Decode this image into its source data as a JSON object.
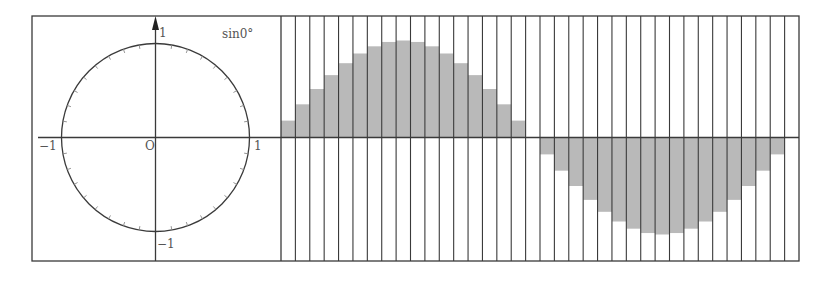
{
  "figure": {
    "title_label": "sin0°",
    "unit_circle": {
      "center": [
        155.5,
        137.5
      ],
      "radius": 94,
      "tick_step_deg": 10,
      "labels": {
        "origin": "O",
        "x_positive": "1",
        "x_negative": "−1",
        "y_positive": "1",
        "y_negative": "−1"
      }
    },
    "colors": {
      "line": "#3a3a3a",
      "bar_fill": "#b9b9b9",
      "label": "#555555",
      "background": "#ffffff"
    }
  },
  "chart_data": {
    "type": "bar",
    "title": "sin0°",
    "xlabel": "angle (degrees, 10° steps)",
    "ylabel": "sin",
    "categories": [
      "10°",
      "20°",
      "30°",
      "40°",
      "50°",
      "60°",
      "70°",
      "80°",
      "90°",
      "100°",
      "110°",
      "120°",
      "130°",
      "140°",
      "150°",
      "160°",
      "170°",
      "180°",
      "190°",
      "200°",
      "210°",
      "220°",
      "230°",
      "240°",
      "250°",
      "260°",
      "270°",
      "280°",
      "290°",
      "300°",
      "310°",
      "320°",
      "330°",
      "340°",
      "350°",
      "360°"
    ],
    "values": [
      0.174,
      0.342,
      0.5,
      0.643,
      0.766,
      0.866,
      0.94,
      0.985,
      1.0,
      0.985,
      0.94,
      0.866,
      0.766,
      0.643,
      0.5,
      0.342,
      0.174,
      0.0,
      -0.174,
      -0.342,
      -0.5,
      -0.643,
      -0.766,
      -0.866,
      -0.94,
      -0.985,
      -1.0,
      -0.985,
      -0.94,
      -0.866,
      -0.766,
      -0.643,
      -0.5,
      -0.342,
      -0.174,
      0.0
    ],
    "ylim": [
      -1,
      1
    ],
    "grid": "vertical column dividers",
    "legend": "none"
  }
}
